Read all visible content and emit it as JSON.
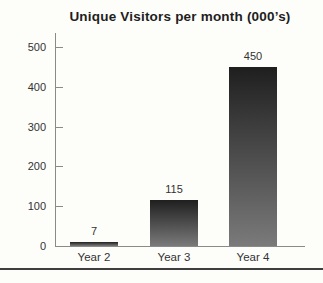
{
  "figure": {
    "background": "#fdfdfa",
    "bottom_rule_color": "#3e3e3e"
  },
  "chart_data": {
    "type": "bar",
    "title": "Unique Visitors per month (000’s)",
    "categories": [
      "Year 2",
      "Year 3",
      "Year 4"
    ],
    "values": [
      7,
      115,
      450
    ],
    "value_labels": [
      "7",
      "115",
      "450"
    ],
    "xlabel": "",
    "ylabel": "",
    "ylim": [
      0,
      500
    ],
    "yticks": [
      0,
      100,
      200,
      300,
      400,
      500
    ],
    "grid": false,
    "legend": false,
    "bar_color_top": "#1f1f1f",
    "bar_color_bottom": "#7a7a7a",
    "axis_color": "#8a8a8a",
    "label_color": "#333333",
    "title_color": "#1e1e1e"
  }
}
